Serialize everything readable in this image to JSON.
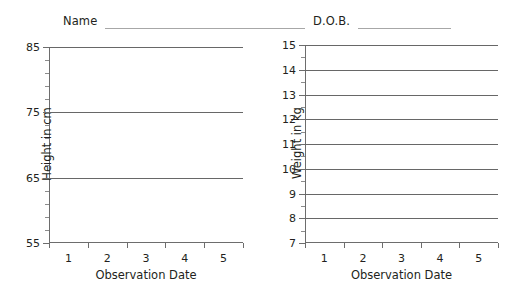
{
  "header": {
    "name_label": "Name",
    "dob_label": "D.O.B."
  },
  "chart_data": [
    {
      "id": "height",
      "type": "line",
      "title": "",
      "xlabel": "Observation Date",
      "ylabel": "Height in cm",
      "categories": [
        "1",
        "2",
        "3",
        "4",
        "5"
      ],
      "series": [],
      "values": [],
      "ylim": [
        55,
        85
      ],
      "ytick_labels": [
        "85",
        "75",
        "65",
        "55"
      ],
      "ytick_values": [
        85,
        75,
        65,
        55
      ],
      "yminor_step": 2,
      "gridlines_y": [
        85,
        75,
        65
      ],
      "grid": true,
      "legend": "none"
    },
    {
      "id": "weight",
      "type": "line",
      "title": "",
      "xlabel": "Observation Date",
      "ylabel": "Weight in kg",
      "categories": [
        "1",
        "2",
        "3",
        "4",
        "5"
      ],
      "series": [],
      "values": [],
      "ylim": [
        7,
        15
      ],
      "ytick_labels": [
        "15",
        "14",
        "13",
        "12",
        "11",
        "10",
        "9",
        "8",
        "7"
      ],
      "ytick_values": [
        15,
        14,
        13,
        12,
        11,
        10,
        9,
        8,
        7
      ],
      "yminor_step": 0.5,
      "gridlines_y": [
        15,
        14,
        13,
        12,
        11,
        10,
        9,
        8
      ],
      "grid": true,
      "legend": "none"
    }
  ],
  "colors": {
    "ink": "#231f20",
    "axis": "#6d6d6d",
    "grid": "#676767",
    "rule": "#a7a7a7",
    "background": "#ffffff"
  }
}
